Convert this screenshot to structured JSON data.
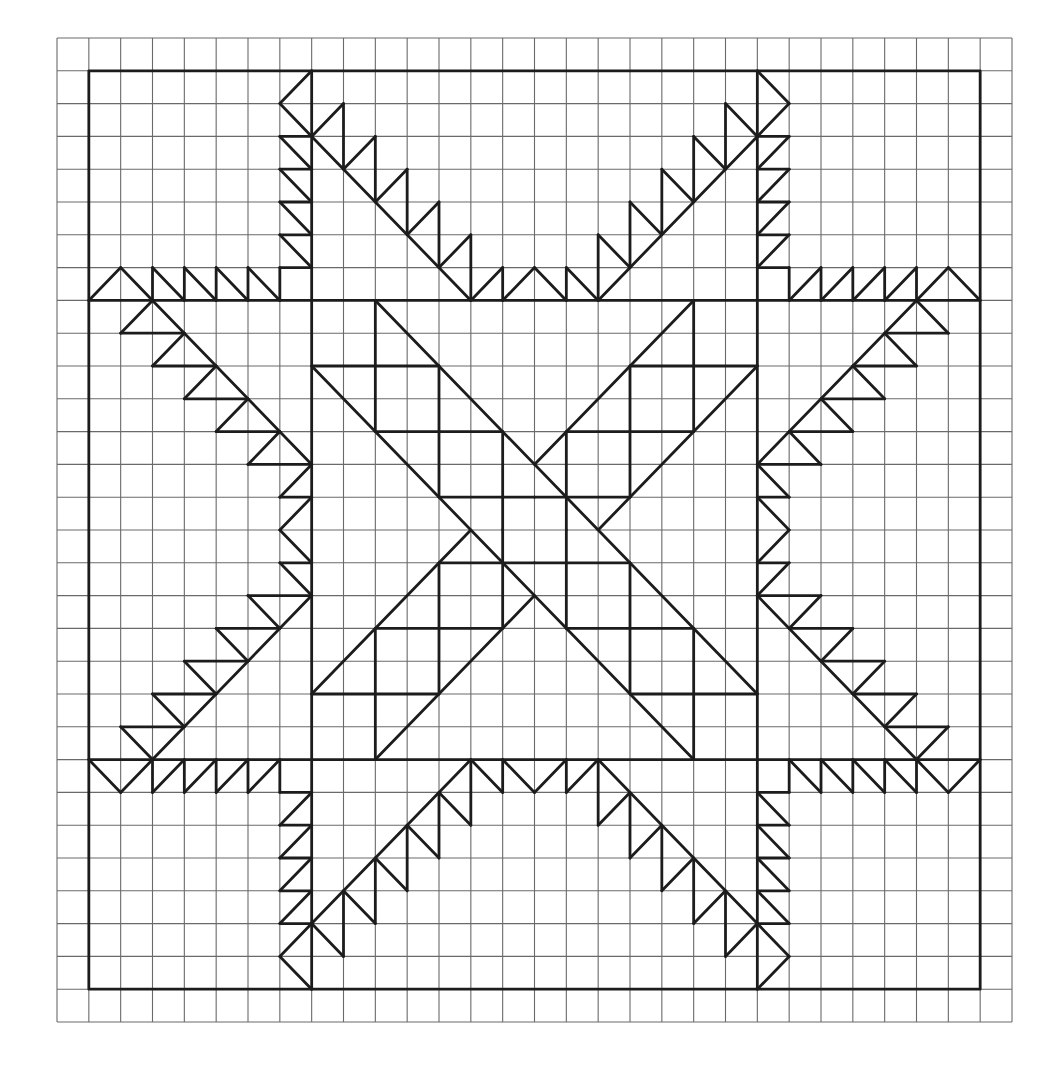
{
  "figure": {
    "title": "Feathered star quilt block on graph paper",
    "grid": {
      "cols": 30,
      "rows": 30
    },
    "colors": {
      "paper": "#ffffff",
      "grid": "#6a6a6a",
      "pattern": "#1c1c1c"
    },
    "frame": {
      "c1": 1,
      "r1": 1,
      "c2": 29,
      "r2": 29
    },
    "structural_lines": [
      [
        1,
        8,
        29,
        8
      ],
      [
        1,
        22,
        29,
        22
      ],
      [
        8,
        1,
        8,
        29
      ],
      [
        22,
        1,
        22,
        29
      ]
    ],
    "mirrored_quadrant_segments": [
      [
        8,
        1,
        7,
        2
      ],
      [
        7,
        2,
        8,
        3
      ],
      [
        7,
        3,
        8,
        3
      ],
      [
        7,
        3,
        8,
        4
      ],
      [
        7,
        4,
        8,
        4
      ],
      [
        7,
        4,
        8,
        5
      ],
      [
        7,
        5,
        8,
        5
      ],
      [
        7,
        5,
        8,
        6
      ],
      [
        7,
        6,
        8,
        6
      ],
      [
        7,
        6,
        8,
        7
      ],
      [
        7,
        7,
        8,
        7
      ],
      [
        7,
        7,
        7,
        8
      ],
      [
        1,
        8,
        2,
        7
      ],
      [
        2,
        7,
        3,
        8
      ],
      [
        3,
        7,
        3,
        8
      ],
      [
        3,
        7,
        4,
        8
      ],
      [
        4,
        7,
        4,
        8
      ],
      [
        4,
        7,
        5,
        8
      ],
      [
        5,
        7,
        5,
        8
      ],
      [
        5,
        7,
        6,
        8
      ],
      [
        6,
        7,
        6,
        8
      ],
      [
        6,
        7,
        7,
        8
      ],
      [
        8,
        3,
        13,
        8
      ],
      [
        8,
        3,
        9,
        2
      ],
      [
        9,
        2,
        9,
        4
      ],
      [
        9,
        4,
        10,
        3
      ],
      [
        10,
        3,
        10,
        5
      ],
      [
        10,
        5,
        11,
        4
      ],
      [
        11,
        4,
        11,
        6
      ],
      [
        11,
        6,
        12,
        5
      ],
      [
        12,
        5,
        12,
        7
      ],
      [
        12,
        7,
        13,
        6
      ],
      [
        13,
        6,
        13,
        8
      ],
      [
        13,
        8,
        14,
        7
      ],
      [
        14,
        7,
        14,
        8
      ],
      [
        14,
        8,
        15,
        7
      ],
      [
        3,
        8,
        8,
        13
      ],
      [
        3,
        8,
        2,
        9
      ],
      [
        2,
        9,
        4,
        9
      ],
      [
        4,
        9,
        3,
        10
      ],
      [
        3,
        10,
        5,
        10
      ],
      [
        5,
        10,
        4,
        11
      ],
      [
        4,
        11,
        6,
        11
      ],
      [
        6,
        11,
        5,
        12
      ],
      [
        5,
        12,
        7,
        12
      ],
      [
        7,
        12,
        6,
        13
      ],
      [
        6,
        13,
        8,
        13
      ],
      [
        8,
        13,
        7,
        14
      ],
      [
        7,
        14,
        8,
        14
      ],
      [
        8,
        14,
        7,
        15
      ],
      [
        10,
        8,
        10,
        12
      ],
      [
        8,
        10,
        12,
        10
      ],
      [
        12,
        10,
        12,
        14
      ],
      [
        10,
        12,
        14,
        12
      ],
      [
        14,
        12,
        14,
        15
      ],
      [
        12,
        14,
        15,
        14
      ]
    ],
    "center_diagonals": [
      [
        10,
        8,
        22,
        20
      ],
      [
        8,
        10,
        20,
        22
      ],
      [
        20,
        8,
        15,
        13
      ],
      [
        22,
        10,
        17,
        15
      ],
      [
        13,
        15,
        8,
        20
      ],
      [
        15,
        17,
        10,
        22
      ]
    ]
  }
}
